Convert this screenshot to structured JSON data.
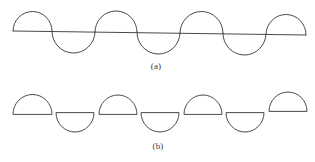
{
  "figure": {
    "title": "",
    "stroke_color": "#4a4a4a",
    "background_color": "#ffffff",
    "captions": {
      "a": "(a)",
      "b": "(b)"
    }
  },
  "chart_data": {
    "type": "line",
    "title": "",
    "subtitle": "",
    "xlabel": "",
    "ylabel": "",
    "grid": false,
    "legend_position": "none",
    "annotations": [
      "(a)",
      "(b)"
    ],
    "panels": [
      {
        "id": "a",
        "caption": "(a)",
        "description": "Continuous wave of alternating semicircular arcs crossing a slightly slanted straight line",
        "baseline": {
          "x1": 13,
          "y1": 31,
          "x2": 306,
          "y2": 35,
          "stroke_width": 1
        },
        "arc_radius": 21,
        "arcs": [
          {
            "index": 1,
            "center_x": 31,
            "center_y": 31,
            "direction": "up"
          },
          {
            "index": 2,
            "center_x": 73,
            "center_y": 32,
            "direction": "down"
          },
          {
            "index": 3,
            "center_x": 116,
            "center_y": 32,
            "direction": "up"
          },
          {
            "index": 4,
            "center_x": 159,
            "center_y": 33,
            "direction": "down"
          },
          {
            "index": 5,
            "center_x": 202,
            "center_y": 33,
            "direction": "up"
          },
          {
            "index": 6,
            "center_x": 244,
            "center_y": 34,
            "direction": "down"
          },
          {
            "index": 7,
            "center_x": 287,
            "center_y": 34,
            "direction": "up"
          }
        ],
        "x": [
          13,
          52,
          95,
          137,
          180,
          223,
          266,
          306
        ],
        "y": [
          31,
          31,
          32,
          32,
          33,
          33,
          34,
          35
        ]
      },
      {
        "id": "b",
        "caption": "(b)",
        "description": "Seven detached half-disks (semicircle plus chord) alternating above and below, offset vertically",
        "arc_radius": 19,
        "shapes": [
          {
            "index": 1,
            "chord_left_x": 13,
            "chord_right_x": 52,
            "chord_y": 114,
            "direction": "up"
          },
          {
            "index": 2,
            "chord_left_x": 56,
            "chord_right_x": 94,
            "chord_y": 113,
            "direction": "down"
          },
          {
            "index": 3,
            "chord_left_x": 99,
            "chord_right_x": 137,
            "chord_y": 114,
            "direction": "up"
          },
          {
            "index": 4,
            "chord_left_x": 141,
            "chord_right_x": 179,
            "chord_y": 113,
            "direction": "down"
          },
          {
            "index": 5,
            "chord_left_x": 184,
            "chord_right_x": 222,
            "chord_y": 114,
            "direction": "up"
          },
          {
            "index": 6,
            "chord_left_x": 226,
            "chord_right_x": 264,
            "chord_y": 113,
            "direction": "down"
          },
          {
            "index": 7,
            "chord_left_x": 269,
            "chord_right_x": 307,
            "chord_y": 111,
            "direction": "up"
          }
        ]
      }
    ]
  }
}
